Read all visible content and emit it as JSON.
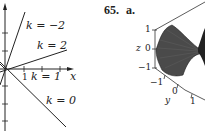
{
  "left_figure": {
    "type": "level_curves",
    "axes": {
      "x_label": "x",
      "tick_label_x": "1"
    },
    "curves": [
      {
        "label": "k = −2"
      },
      {
        "label": "k = 2"
      },
      {
        "label": "k = 1"
      },
      {
        "label": "k = 0"
      }
    ]
  },
  "right_figure": {
    "exercise": "65.",
    "part": "a.",
    "type": "surface_3d",
    "z_axis": {
      "label": "z",
      "ticks": [
        "1",
        "0",
        "−1"
      ]
    },
    "y_axis": {
      "label": "y",
      "ticks": [
        "−1",
        "0",
        "1"
      ]
    }
  },
  "colors": {
    "ink": "#222222",
    "surface": "#444444",
    "background": "#ffffff"
  }
}
